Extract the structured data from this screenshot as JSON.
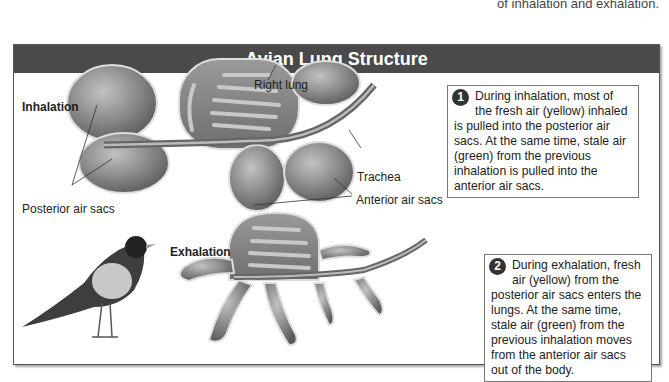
{
  "top_caption": "of inhalation and exhalation.",
  "figure": {
    "title": "Avian Lung Structure",
    "panels": {
      "inhalation": {
        "label": "Inhalation",
        "callouts": {
          "right_lung": "Right lung",
          "trachea": "Trachea",
          "posterior_air_sacs": "Posterior air sacs",
          "anterior_air_sacs": "Anterior air sacs"
        }
      },
      "exhalation": {
        "label": "Exhalation"
      }
    },
    "notes": [
      {
        "number": "1",
        "text": "During inhalation, most of the fresh air (yellow) inhaled is pulled into the posterior air sacs. At the same time, stale air (green) from the previous inhalation is pulled into the anterior air sacs."
      },
      {
        "number": "2",
        "text": "During exhalation, fresh air (yellow) from the posterior air sacs enters the lungs. At the same time, stale air (green) from the previous inhalation moves from the anterior air sacs out of the body."
      }
    ],
    "colors": {
      "title_bar": "#4a4a4a",
      "organ_fill": "#8a8a8a",
      "organ_dark": "#5e5e5e"
    }
  }
}
